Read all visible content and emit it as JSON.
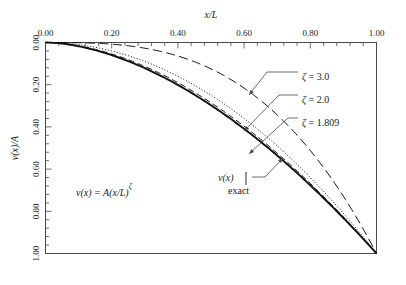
{
  "chart_data": {
    "type": "line",
    "title": "",
    "xlabel": "x/L",
    "ylabel": "v(x)/A",
    "xlim": [
      0.0,
      1.0
    ],
    "ylim": [
      0.0,
      1.0
    ],
    "y_axis_inverted": true,
    "x_axis_position": "top",
    "grid": false,
    "legend_position": "inline-annotations",
    "x_ticks": [
      "0.00",
      "0.20",
      "0.40",
      "0.60",
      "0.80",
      "1.00"
    ],
    "x_tick_values": [
      0.0,
      0.2,
      0.4,
      0.6,
      0.8,
      1.0
    ],
    "y_ticks": [
      "0.00",
      "0.20",
      "0.40",
      "0.60",
      "0.80",
      "1.00"
    ],
    "y_tick_values": [
      0.0,
      0.2,
      0.4,
      0.6,
      0.8,
      1.0
    ],
    "minor_ticks_per_interval": 5,
    "equation_annotation": "v(x) = A(x/L)ζ",
    "series": [
      {
        "name": "exact",
        "label": "v(x)|exact",
        "style": "solid",
        "exponent": 1.75,
        "x": [
          0.0,
          0.05,
          0.1,
          0.15,
          0.2,
          0.25,
          0.3,
          0.35,
          0.4,
          0.45,
          0.5,
          0.55,
          0.6,
          0.65,
          0.7,
          0.75,
          0.8,
          0.85,
          0.9,
          0.95,
          1.0
        ],
        "values": [
          0.0,
          0.006,
          0.02,
          0.041,
          0.067,
          0.099,
          0.136,
          0.177,
          0.223,
          0.273,
          0.327,
          0.385,
          0.446,
          0.511,
          0.58,
          0.652,
          0.727,
          0.806,
          0.887,
          0.972,
          1.0
        ]
      },
      {
        "name": "zeta-1.809",
        "label": "ζ = 1.809",
        "style": "dashed",
        "exponent": 1.809,
        "x": [
          0.0,
          0.05,
          0.1,
          0.15,
          0.2,
          0.25,
          0.3,
          0.35,
          0.4,
          0.45,
          0.5,
          0.55,
          0.6,
          0.65,
          0.7,
          0.75,
          0.8,
          0.85,
          0.9,
          0.95,
          1.0
        ],
        "values": [
          0.0,
          0.005,
          0.018,
          0.037,
          0.061,
          0.091,
          0.126,
          0.166,
          0.21,
          0.259,
          0.312,
          0.369,
          0.43,
          0.495,
          0.564,
          0.637,
          0.713,
          0.793,
          0.877,
          0.964,
          1.0
        ]
      },
      {
        "name": "zeta-2.0",
        "label": "ζ = 2.0",
        "style": "dotted",
        "exponent": 2.0,
        "x": [
          0.0,
          0.05,
          0.1,
          0.15,
          0.2,
          0.25,
          0.3,
          0.35,
          0.4,
          0.45,
          0.5,
          0.55,
          0.6,
          0.65,
          0.7,
          0.75,
          0.8,
          0.85,
          0.9,
          0.95,
          1.0
        ],
        "values": [
          0.0,
          0.003,
          0.01,
          0.023,
          0.04,
          0.063,
          0.09,
          0.123,
          0.16,
          0.203,
          0.25,
          0.303,
          0.36,
          0.423,
          0.49,
          0.563,
          0.64,
          0.723,
          0.81,
          0.903,
          1.0
        ]
      },
      {
        "name": "zeta-3.0",
        "label": "ζ = 3.0",
        "style": "longdash",
        "exponent": 3.0,
        "x": [
          0.0,
          0.05,
          0.1,
          0.15,
          0.2,
          0.25,
          0.3,
          0.35,
          0.4,
          0.45,
          0.5,
          0.55,
          0.6,
          0.65,
          0.7,
          0.75,
          0.8,
          0.85,
          0.9,
          0.95,
          1.0
        ],
        "values": [
          0.0,
          0.0,
          0.001,
          0.003,
          0.008,
          0.016,
          0.027,
          0.043,
          0.064,
          0.091,
          0.125,
          0.166,
          0.216,
          0.275,
          0.343,
          0.422,
          0.512,
          0.614,
          0.729,
          0.857,
          1.0
        ]
      }
    ],
    "annotations": [
      {
        "name": "zeta-3.0-label",
        "text": "ζ = 3.0",
        "label_x": 302,
        "label_y": 76,
        "leader": [
          [
            298,
            72
          ],
          [
            267,
            72
          ],
          [
            249,
            95
          ]
        ]
      },
      {
        "name": "zeta-2.0-label",
        "text": "ζ = 2.0",
        "label_x": 302,
        "label_y": 99,
        "leader": [
          [
            298,
            95
          ],
          [
            279,
            95
          ],
          [
            244,
            131
          ]
        ]
      },
      {
        "name": "zeta-1.809-label",
        "text": "ζ = 1.809",
        "label_x": 302,
        "label_y": 122,
        "leader": [
          [
            298,
            118
          ],
          [
            288,
            118
          ],
          [
            249,
            154
          ]
        ]
      },
      {
        "name": "exact-label",
        "text": "v(x)",
        "label_x": 218,
        "label_y": 181,
        "leader": [
          [
            252,
            177
          ],
          [
            265,
            177
          ],
          [
            283,
            158
          ]
        ]
      }
    ]
  }
}
